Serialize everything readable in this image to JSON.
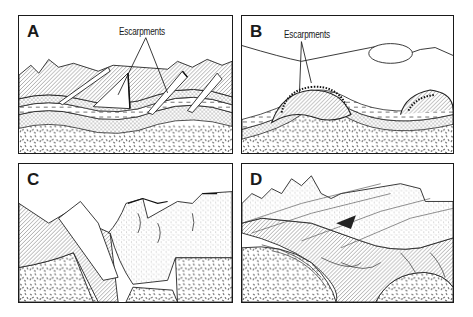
{
  "figure": {
    "panels": [
      {
        "id": "A",
        "letter": "A",
        "callout": "Escarpments",
        "description": "Tilted sedimentary layers eroded into parallel escarpment ridges over folded strata and crystalline basement"
      },
      {
        "id": "B",
        "letter": "B",
        "callout": "Escarpments",
        "description": "Breached anticlinal dome with curved inward-facing escarpments above folded layers"
      },
      {
        "id": "C",
        "letter": "C",
        "callout": "",
        "description": "Faulted plateau with block-faulted layers over crystalline basement and eroded canyon"
      },
      {
        "id": "D",
        "letter": "D",
        "callout": "",
        "description": "Folded and thrust-faulted mountain belt with deformed layered rocks over basement"
      }
    ],
    "colors": {
      "ink": "#1a1a1a",
      "paper": "#ffffff"
    }
  }
}
